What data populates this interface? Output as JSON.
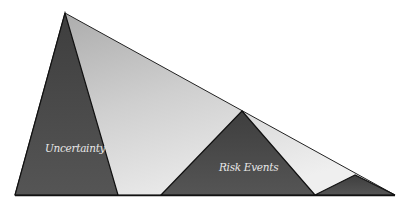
{
  "diagram": {
    "labels": {
      "uncertainty": "Uncertainty",
      "risk_events": "Risk Events"
    },
    "colors": {
      "background_triangle": "#c4c4c4",
      "background_triangle_light": "#e6e6e6",
      "dark_triangles": "#4a4a4a",
      "outline": "#1a1a1a",
      "label_text": "#e8e8e8"
    },
    "shapes": [
      {
        "name": "envelope-triangle",
        "points": [
          [
            65,
            13
          ],
          [
            15,
            195
          ],
          [
            395,
            195
          ]
        ],
        "fill": "light-gradient"
      },
      {
        "name": "uncertainty-triangle",
        "points": [
          [
            65,
            13
          ],
          [
            15,
            195
          ],
          [
            118,
            195
          ]
        ],
        "fill": "dark"
      },
      {
        "name": "risk-events-triangle",
        "points": [
          [
            242,
            111
          ],
          [
            161,
            195
          ],
          [
            315,
            195
          ]
        ],
        "fill": "dark"
      },
      {
        "name": "small-risk-triangle",
        "points": [
          [
            355,
            175
          ],
          [
            315,
            195
          ],
          [
            395,
            195
          ]
        ],
        "fill": "dark"
      }
    ]
  }
}
